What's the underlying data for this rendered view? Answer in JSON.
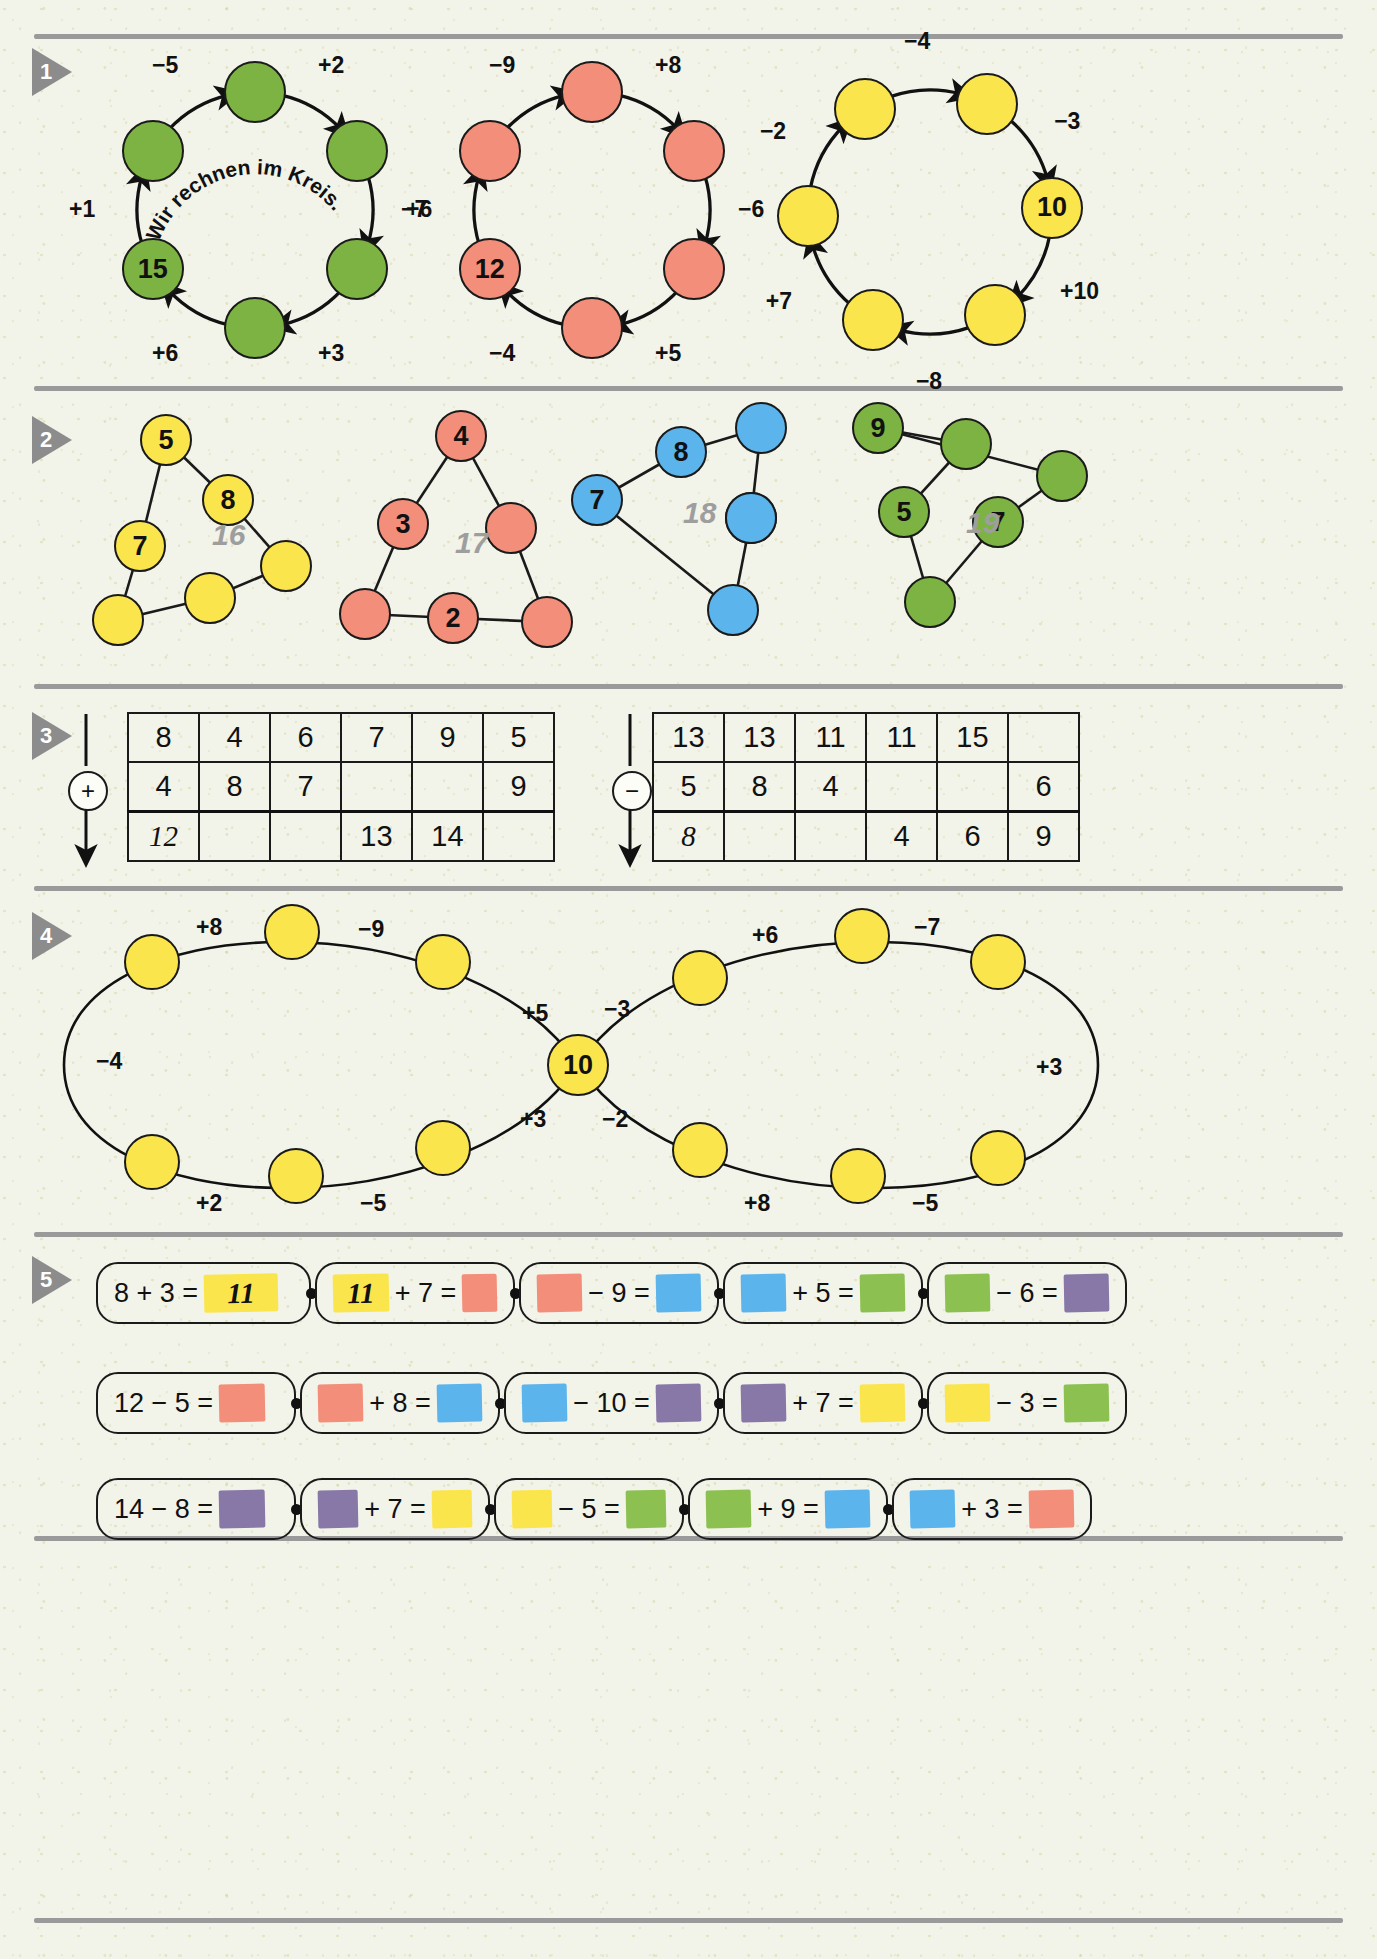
{
  "page": {
    "language": "de"
  },
  "exercises": [
    {
      "number": "1",
      "motto": "Wir rechnen im Kreis.",
      "circles": [
        {
          "id": "circle-green",
          "color": "#7cb342",
          "given": {
            "position": 4,
            "value": "15"
          },
          "steps": [
            "+2",
            "−7",
            "+3",
            "+6",
            "+1",
            "−5"
          ]
        },
        {
          "id": "circle-red",
          "color": "#f28e7a",
          "given": {
            "position": 4,
            "value": "12"
          },
          "steps": [
            "+8",
            "−6",
            "+5",
            "−4",
            "+6",
            "−9"
          ]
        },
        {
          "id": "circle-yellow",
          "color": "#fbe54d",
          "given": {
            "position": 1,
            "value": "10"
          },
          "steps": [
            "−3",
            "+10",
            "−8",
            "+7",
            "−2",
            "−4"
          ]
        }
      ]
    },
    {
      "number": "2",
      "triangles": [
        {
          "id": "tri-yellow",
          "color": "#fbe54d",
          "sum": "16",
          "values": [
            "5",
            "8",
            "7"
          ]
        },
        {
          "id": "tri-red",
          "color": "#f28e7a",
          "sum": "17",
          "values": [
            "4",
            "3",
            "2"
          ]
        },
        {
          "id": "tri-blue",
          "color": "#5bb4ec",
          "sum": "18",
          "values": [
            "8",
            "9",
            "7"
          ]
        },
        {
          "id": "tri-green",
          "color": "#7cb342",
          "sum": "19",
          "values": [
            "9",
            "5",
            "7"
          ]
        }
      ]
    },
    {
      "number": "3",
      "tables": [
        {
          "id": "table-addition",
          "operator": "+",
          "rows": [
            [
              "8",
              "4",
              "6",
              "7",
              "9",
              "5"
            ],
            [
              "4",
              "8",
              "7",
              "",
              "",
              "9"
            ],
            [
              "12",
              "",
              "",
              "13",
              "14",
              ""
            ]
          ],
          "handwritten_cells": [
            [
              2,
              0
            ]
          ]
        },
        {
          "id": "table-subtraction",
          "operator": "−",
          "rows": [
            [
              "13",
              "13",
              "11",
              "11",
              "15",
              ""
            ],
            [
              "5",
              "8",
              "4",
              "",
              "",
              "6"
            ],
            [
              "8",
              "",
              "",
              "4",
              "6",
              "9"
            ]
          ],
          "handwritten_cells": [
            [
              2,
              0
            ]
          ]
        }
      ]
    },
    {
      "number": "4",
      "figure_eight": {
        "id": "figure-eight-chain",
        "color": "#fbe54d",
        "center_value": "10",
        "labels_left_loop": [
          "+8",
          "−9",
          "+5",
          "+3",
          "−5",
          "+2",
          "−4"
        ],
        "labels_right_loop": [
          "−3",
          "+6",
          "−7",
          "+3",
          "−5",
          "+8",
          "−2"
        ],
        "all_labels": [
          "+8",
          "−9",
          "+5",
          "−3",
          "+6",
          "−7",
          "−4",
          "+3",
          "+2",
          "−5",
          "+3",
          "−2",
          "+8",
          "−5"
        ]
      }
    },
    {
      "number": "5",
      "chain_rows": [
        {
          "id": "chain-row-1",
          "links": [
            {
              "left_text": "8 + 3 =",
              "left_swatch": null,
              "right_swatch": {
                "color": "#fbe54d",
                "value": "11"
              }
            },
            {
              "left_text": "+ 7 =",
              "left_swatch": {
                "color": "#fbe54d",
                "value": "11"
              },
              "right_swatch": {
                "color": "#f28e7a",
                "value": ""
              }
            },
            {
              "left_text": "− 9 =",
              "left_swatch": {
                "color": "#f28e7a",
                "value": ""
              },
              "right_swatch": {
                "color": "#5bb4ec",
                "value": ""
              }
            },
            {
              "left_text": "+ 5 =",
              "left_swatch": {
                "color": "#5bb4ec",
                "value": ""
              },
              "right_swatch": {
                "color": "#8cc152",
                "value": ""
              }
            },
            {
              "left_text": "− 6 =",
              "left_swatch": {
                "color": "#8cc152",
                "value": ""
              },
              "right_swatch": {
                "color": "#8878a8",
                "value": ""
              }
            }
          ]
        },
        {
          "id": "chain-row-2",
          "links": [
            {
              "left_text": "12 − 5 =",
              "left_swatch": null,
              "right_swatch": {
                "color": "#f28e7a",
                "value": ""
              }
            },
            {
              "left_text": "+ 8 =",
              "left_swatch": {
                "color": "#f28e7a",
                "value": ""
              },
              "right_swatch": {
                "color": "#5bb4ec",
                "value": ""
              }
            },
            {
              "left_text": "− 10 =",
              "left_swatch": {
                "color": "#5bb4ec",
                "value": ""
              },
              "right_swatch": {
                "color": "#8878a8",
                "value": ""
              }
            },
            {
              "left_text": "+ 7 =",
              "left_swatch": {
                "color": "#8878a8",
                "value": ""
              },
              "right_swatch": {
                "color": "#fbe54d",
                "value": ""
              }
            },
            {
              "left_text": "− 3 =",
              "left_swatch": {
                "color": "#fbe54d",
                "value": ""
              },
              "right_swatch": {
                "color": "#8cc152",
                "value": ""
              }
            }
          ]
        },
        {
          "id": "chain-row-3",
          "links": [
            {
              "left_text": "14 − 8 =",
              "left_swatch": null,
              "right_swatch": {
                "color": "#8878a8",
                "value": ""
              }
            },
            {
              "left_text": "+ 7 =",
              "left_swatch": {
                "color": "#8878a8",
                "value": ""
              },
              "right_swatch": {
                "color": "#fbe54d",
                "value": ""
              }
            },
            {
              "left_text": "− 5 =",
              "left_swatch": {
                "color": "#fbe54d",
                "value": ""
              },
              "right_swatch": {
                "color": "#8cc152",
                "value": ""
              }
            },
            {
              "left_text": "+ 9 =",
              "left_swatch": {
                "color": "#8cc152",
                "value": ""
              },
              "right_swatch": {
                "color": "#5bb4ec",
                "value": ""
              }
            },
            {
              "left_text": "+ 3 =",
              "left_swatch": {
                "color": "#5bb4ec",
                "value": ""
              },
              "right_swatch": {
                "color": "#f28e7a",
                "value": ""
              }
            }
          ]
        }
      ]
    }
  ],
  "colors": {
    "green": "#7cb342",
    "green_light": "#8cc152",
    "red": "#f28e7a",
    "yellow": "#fbe54d",
    "blue": "#5bb4ec",
    "purple": "#8878a8",
    "divider": "#9a9a9a",
    "marker": "#8c8c8c",
    "sum_text": "#9e9e9e"
  }
}
